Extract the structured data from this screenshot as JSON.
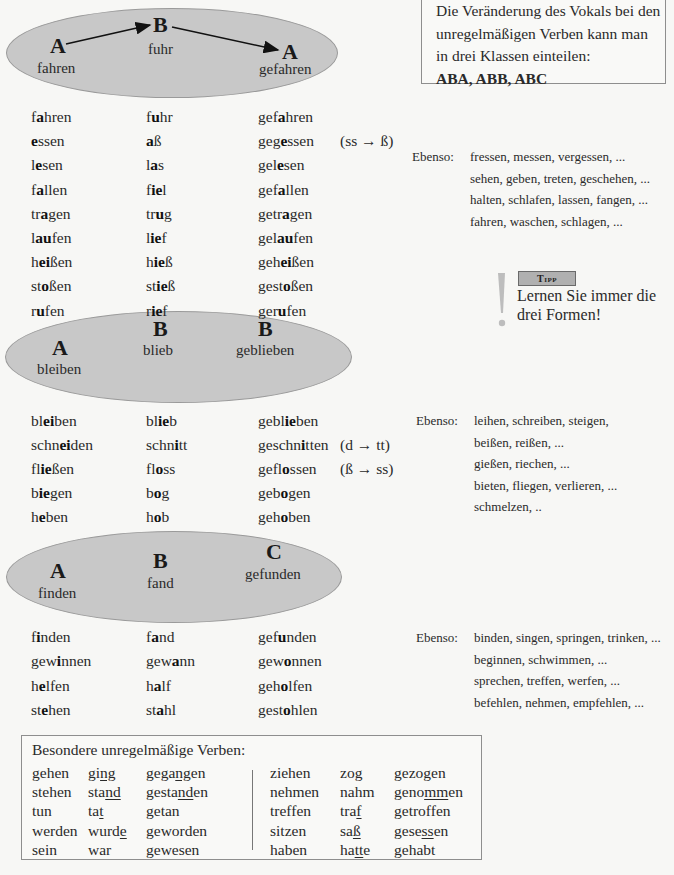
{
  "info_box": {
    "lines": [
      "Die Veränderung des Vokals bei den",
      "unregelmäßigen Verben kann man",
      "in drei Klassen einteilen:"
    ],
    "classes": "ABA, ABB, ABC"
  },
  "diagrams": [
    {
      "pattern": "ABA",
      "letters": [
        "A",
        "B",
        "A"
      ],
      "labels": [
        "fahren",
        "fuhr",
        "gefahren"
      ]
    },
    {
      "pattern": "ABB",
      "letters": [
        "A",
        "B",
        "B"
      ],
      "labels": [
        "bleiben",
        "blieb",
        "geblieben"
      ]
    },
    {
      "pattern": "ABC",
      "letters": [
        "A",
        "B",
        "C"
      ],
      "labels": [
        "finden",
        "fand",
        "gefunden"
      ]
    }
  ],
  "groups": [
    {
      "rows": [
        {
          "forms": [
            [
              "f",
              "a",
              "hren"
            ],
            [
              "f",
              "u",
              "hr"
            ],
            [
              "gef",
              "a",
              "hren"
            ]
          ],
          "note": ""
        },
        {
          "forms": [
            [
              "",
              "e",
              "ssen"
            ],
            [
              "",
              "a",
              "ß"
            ],
            [
              "geg",
              "e",
              "ssen"
            ]
          ],
          "note": "(ss → ß)"
        },
        {
          "forms": [
            [
              "l",
              "e",
              "sen"
            ],
            [
              "l",
              "a",
              "s"
            ],
            [
              "gel",
              "e",
              "sen"
            ]
          ],
          "note": ""
        },
        {
          "forms": [
            [
              "f",
              "a",
              "llen"
            ],
            [
              "f",
              "ie",
              "l"
            ],
            [
              "gef",
              "a",
              "llen"
            ]
          ],
          "note": ""
        },
        {
          "forms": [
            [
              "tr",
              "a",
              "gen"
            ],
            [
              "tr",
              "u",
              "g"
            ],
            [
              "getr",
              "a",
              "gen"
            ]
          ],
          "note": ""
        },
        {
          "forms": [
            [
              "l",
              "au",
              "fen"
            ],
            [
              "l",
              "ie",
              "f"
            ],
            [
              "gel",
              "au",
              "fen"
            ]
          ],
          "note": ""
        },
        {
          "forms": [
            [
              "h",
              "ei",
              "ßen"
            ],
            [
              "h",
              "ie",
              "ß"
            ],
            [
              "geh",
              "ei",
              "ßen"
            ]
          ],
          "note": ""
        },
        {
          "forms": [
            [
              "st",
              "o",
              "ßen"
            ],
            [
              "st",
              "ie",
              "ß"
            ],
            [
              "gest",
              "o",
              "ßen"
            ]
          ],
          "note": ""
        },
        {
          "forms": [
            [
              "r",
              "u",
              "fen"
            ],
            [
              "r",
              "ie",
              "f"
            ],
            [
              "ger",
              "u",
              "fen"
            ]
          ],
          "note": ""
        }
      ],
      "ebenso_label": "Ebenso:",
      "ebenso": [
        "fressen, messen, vergessen, ...",
        "sehen, geben, treten, geschehen, ...",
        "halten, schlafen, lassen, fangen, ...",
        "fahren, waschen, schlagen, ..."
      ]
    },
    {
      "rows": [
        {
          "forms": [
            [
              "bl",
              "ei",
              "ben"
            ],
            [
              "bl",
              "ie",
              "b"
            ],
            [
              "gebl",
              "ie",
              "ben"
            ]
          ],
          "note": ""
        },
        {
          "forms": [
            [
              "schn",
              "ei",
              "den"
            ],
            [
              "schn",
              "i",
              "tt"
            ],
            [
              "geschn",
              "i",
              "tten"
            ]
          ],
          "note": "(d → tt)"
        },
        {
          "forms": [
            [
              "fl",
              "ie",
              "ßen"
            ],
            [
              "fl",
              "o",
              "ss"
            ],
            [
              "gefl",
              "o",
              "ssen"
            ]
          ],
          "note": "(ß → ss)"
        },
        {
          "forms": [
            [
              "b",
              "ie",
              "gen"
            ],
            [
              "b",
              "o",
              "g"
            ],
            [
              "geb",
              "o",
              "gen"
            ]
          ],
          "note": ""
        },
        {
          "forms": [
            [
              "h",
              "e",
              "ben"
            ],
            [
              "h",
              "o",
              "b"
            ],
            [
              "geh",
              "o",
              "ben"
            ]
          ],
          "note": ""
        }
      ],
      "ebenso_label": "Ebenso:",
      "ebenso": [
        "leihen, schreiben, steigen,",
        "beißen, reißen, ...",
        "gießen, riechen, ...",
        "bieten, fliegen, verlieren, ...",
        "schmelzen, .."
      ]
    },
    {
      "rows": [
        {
          "forms": [
            [
              "f",
              "i",
              "nden"
            ],
            [
              "f",
              "a",
              "nd"
            ],
            [
              "gef",
              "u",
              "nden"
            ]
          ],
          "note": ""
        },
        {
          "forms": [
            [
              "gew",
              "i",
              "nnen"
            ],
            [
              "gew",
              "a",
              "nn"
            ],
            [
              "gew",
              "o",
              "nnen"
            ]
          ],
          "note": ""
        },
        {
          "forms": [
            [
              "h",
              "e",
              "lfen"
            ],
            [
              "h",
              "a",
              "lf"
            ],
            [
              "geh",
              "o",
              "lfen"
            ]
          ],
          "note": ""
        },
        {
          "forms": [
            [
              "st",
              "e",
              "hen"
            ],
            [
              "st",
              "a",
              "hl"
            ],
            [
              "gest",
              "o",
              "hlen"
            ]
          ],
          "note": ""
        }
      ],
      "ebenso_label": "Ebenso:",
      "ebenso": [
        "binden, singen, springen, trinken, ...",
        "beginnen, schwimmen, ...",
        "sprechen, treffen, werfen, ...",
        "befehlen, nehmen, empfehlen, ..."
      ]
    }
  ],
  "tipp": {
    "badge": "Tipp",
    "lines": [
      "Lernen Sie immer die",
      "drei Formen!"
    ]
  },
  "special": {
    "title": "Besondere unregelmäßige Verben:",
    "left": [
      [
        [
          "gehen"
        ],
        [
          "gi",
          "ng",
          ""
        ],
        [
          "gega",
          "ng",
          "en"
        ]
      ],
      [
        [
          "stehen"
        ],
        [
          "sta",
          "nd",
          ""
        ],
        [
          "gesta",
          "nd",
          "en"
        ]
      ],
      [
        [
          "tun"
        ],
        [
          "ta",
          "t",
          ""
        ],
        [
          "getan"
        ]
      ],
      [
        [
          "werden"
        ],
        [
          "wurd",
          "e",
          ""
        ],
        [
          "geworden"
        ]
      ],
      [
        [
          "sein"
        ],
        [
          "war"
        ],
        [
          "gewesen"
        ]
      ]
    ],
    "right": [
      [
        [
          "ziehen"
        ],
        [
          "zo",
          "g",
          ""
        ],
        [
          "gezo",
          "g",
          "en"
        ]
      ],
      [
        [
          "nehmen"
        ],
        [
          "nahm"
        ],
        [
          "geno",
          "mm",
          "en"
        ]
      ],
      [
        [
          "treffen"
        ],
        [
          "tra",
          "f",
          ""
        ],
        [
          "getroffen"
        ]
      ],
      [
        [
          "sitzen"
        ],
        [
          "sa",
          "ß",
          ""
        ],
        [
          "gese",
          "ss",
          "en"
        ]
      ],
      [
        [
          "haben"
        ],
        [
          "ha",
          "tt",
          "e"
        ],
        [
          "gehabt"
        ]
      ]
    ]
  }
}
